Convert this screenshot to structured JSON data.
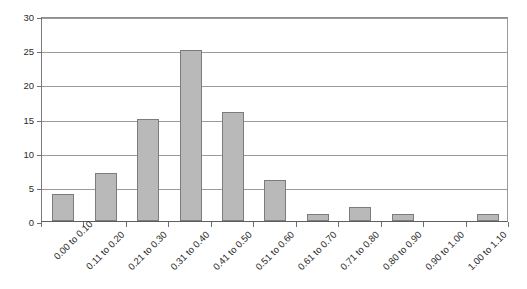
{
  "chart_data": {
    "type": "bar",
    "title": "",
    "subtitle": "",
    "xlabel": "",
    "ylabel": "",
    "categories": [
      "0.00 to 0.10",
      "0.11 to 0.20",
      "0.21 to 0.30",
      "0.31 to 0.40",
      "0.41 to 0.50",
      "0.51 to 0.60",
      "0.61 to 0.70",
      "0.71 to 0.80",
      "0.80 to 0.90",
      "0.90 to 1.00",
      "1.00 to 1.10"
    ],
    "values": [
      4,
      7,
      15,
      25,
      16,
      6,
      1,
      2,
      1,
      0,
      1
    ],
    "ylim": [
      0,
      30
    ],
    "ytick_values": [
      0,
      5,
      10,
      15,
      20,
      25,
      30
    ],
    "ytick_labels": [
      "0",
      "5",
      "10",
      "15",
      "20",
      "25",
      "30"
    ],
    "grid": "horizontal",
    "legend": "none",
    "bar_color": "#b9b9b9",
    "bar_border_color": "#7c7c7c",
    "gridline_color": "#9b9b9b",
    "axis_color": "#5e5e5e",
    "background_color": "#ffffff",
    "x_label_rotation_deg": -45,
    "annotations": []
  }
}
